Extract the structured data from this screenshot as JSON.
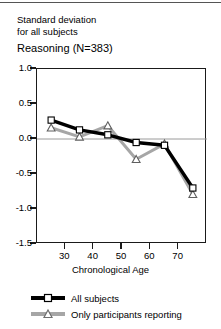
{
  "figure": {
    "caption_lines": [
      "Standard deviation",
      "for all subjects"
    ],
    "title": "Reasoning (N=383)"
  },
  "chart_data": {
    "type": "line",
    "title": "Reasoning (N=383)",
    "subtitle": "Standard deviation for all subjects",
    "xlabel": "Chronological Age",
    "ylabel": "",
    "xlim": [
      20,
      80
    ],
    "ylim": [
      -1.5,
      1.0
    ],
    "xticks": [
      30,
      40,
      50,
      60,
      70
    ],
    "yticks": [
      1.0,
      0.5,
      0.0,
      -0.5,
      -1.0,
      -1.5
    ],
    "xtick_labels": [
      "30",
      "40",
      "50",
      "60",
      "70"
    ],
    "ytick_labels": [
      "1.0",
      "0.5",
      "0.0",
      "-0.5",
      "-1.0",
      "-1.5"
    ],
    "grid": false,
    "zero_line": true,
    "legend_position": "below",
    "x": [
      25,
      35,
      45,
      55,
      65,
      75
    ],
    "series": [
      {
        "name": "All subjects",
        "color": "#000000",
        "marker": "square",
        "values": [
          0.27,
          0.13,
          0.06,
          -0.05,
          -0.09,
          -0.7
        ]
      },
      {
        "name": "Only participants reporting",
        "color": "#a6a6a6",
        "marker": "triangle",
        "values": [
          0.16,
          0.03,
          0.19,
          -0.29,
          -0.07,
          -0.79
        ]
      }
    ]
  },
  "legend": {
    "items": [
      {
        "label": "All subjects"
      },
      {
        "label": "Only participants reporting"
      }
    ]
  }
}
